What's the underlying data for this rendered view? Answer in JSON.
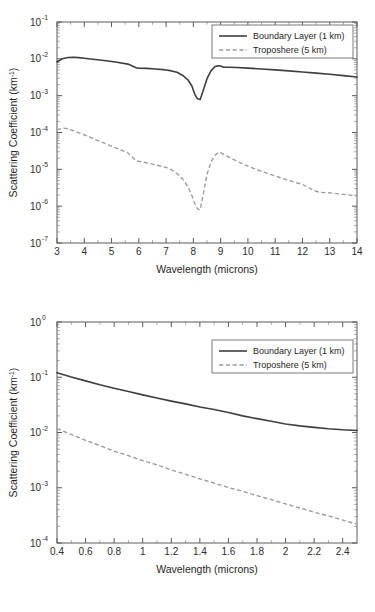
{
  "figure": {
    "panel_count": 2,
    "colors": {
      "boundary_layer": "#3f3f3f",
      "troposphere": "#9a9a9a",
      "axis": "#5a5a5a",
      "background": "#ffffff"
    }
  },
  "chart_data": [
    {
      "id": "infrared-panel",
      "type": "line",
      "title": "",
      "xlabel": "Wavelength (microns)",
      "ylabel": "Scattering Coefficient (km",
      "ylabel_sup": "-1",
      "ylabel_tail": ")",
      "xlim": [
        3,
        14
      ],
      "ylim": [
        1e-07,
        0.1
      ],
      "xscale": "linear",
      "yscale": "log",
      "grid": false,
      "legend_position": "top-right",
      "xticks": [
        "3",
        "4",
        "5",
        "6",
        "7",
        "8",
        "9",
        "10",
        "11",
        "12",
        "13",
        "14"
      ],
      "xtick_values": [
        3,
        4,
        5,
        6,
        7,
        8,
        9,
        10,
        11,
        12,
        13,
        14
      ],
      "yticks": [
        "10-1",
        "10-2",
        "10-3",
        "10-4",
        "10-5",
        "10-6",
        "10-7"
      ],
      "ytick_mantissa": "10",
      "ytick_exponents": [
        "-1",
        "-2",
        "-3",
        "-4",
        "-5",
        "-6",
        "-7"
      ],
      "ytick_values": [
        0.1,
        0.01,
        0.001,
        0.0001,
        1e-05,
        1e-06,
        1e-07
      ],
      "series": [
        {
          "name": "Boundary Layer (1 km)",
          "style": "solid",
          "color": "#3f3f3f",
          "x": [
            3.0,
            3.2,
            3.4,
            3.6,
            3.8,
            4.0,
            4.4,
            4.8,
            5.2,
            5.6,
            5.9,
            6.0,
            6.3,
            6.6,
            6.9,
            7.0,
            7.2,
            7.4,
            7.6,
            7.8,
            7.95,
            8.05,
            8.15,
            8.25,
            8.35,
            8.5,
            8.65,
            8.8,
            8.9,
            9.0,
            9.1,
            9.3,
            9.6,
            10.0,
            10.5,
            11.0,
            11.5,
            12.0,
            12.5,
            13.0,
            13.5,
            14.0
          ],
          "y": [
            0.0082,
            0.0101,
            0.0109,
            0.011,
            0.0108,
            0.0104,
            0.0096,
            0.0089,
            0.0081,
            0.0072,
            0.0057,
            0.0056,
            0.0055,
            0.0053,
            0.0051,
            0.005,
            0.0047,
            0.0043,
            0.0036,
            0.0027,
            0.0018,
            0.0011,
            0.00082,
            0.00079,
            0.0013,
            0.0029,
            0.0048,
            0.0062,
            0.0065,
            0.0064,
            0.0059,
            0.0059,
            0.0058,
            0.0056,
            0.0053,
            0.005,
            0.0047,
            0.0044,
            0.0041,
            0.0038,
            0.0035,
            0.0032
          ]
        },
        {
          "name": "Troposhere (5 km)",
          "style": "dashed",
          "color": "#9a9a9a",
          "x": [
            3.0,
            3.2,
            3.4,
            3.6,
            3.8,
            4.0,
            4.4,
            4.8,
            5.2,
            5.6,
            5.9,
            6.0,
            6.3,
            6.6,
            6.9,
            7.0,
            7.2,
            7.4,
            7.6,
            7.8,
            7.95,
            8.05,
            8.15,
            8.25,
            8.35,
            8.5,
            8.65,
            8.8,
            8.9,
            9.0,
            9.1,
            9.3,
            9.6,
            10.0,
            10.5,
            11.0,
            11.5,
            12.0,
            12.4,
            12.6,
            13.0,
            13.5,
            14.0
          ],
          "y": [
            0.000118,
            0.000132,
            0.000126,
            0.000112,
            9.75e-05,
            8.6e-05,
            6.5e-05,
            4.9e-05,
            3.7e-05,
            2.8e-05,
            1.7e-05,
            1.65e-05,
            1.5e-05,
            1.33e-05,
            1.17e-05,
            1.13e-05,
            9.7e-06,
            7.7e-06,
            5.5e-06,
            3.4e-06,
            1.9e-06,
            1.2e-06,
            8.5e-07,
            8e-07,
            1.9e-06,
            7.3e-06,
            1.6e-05,
            2.45e-05,
            2.8e-05,
            2.85e-05,
            2.55e-05,
            2.15e-05,
            1.65e-05,
            1.22e-05,
            8.8e-06,
            6.6e-06,
            5e-06,
            3.9e-06,
            2.7e-06,
            2.4e-06,
            2.3e-06,
            2.1e-06,
            1.9e-06
          ]
        }
      ]
    },
    {
      "id": "visible-panel",
      "type": "line",
      "title": "",
      "xlabel": "Wavelength (microns)",
      "ylabel": "Scattering Coefficient (km",
      "ylabel_sup": "-1",
      "ylabel_tail": ")",
      "xlim": [
        0.4,
        2.5
      ],
      "ylim": [
        0.0001,
        1
      ],
      "xscale": "linear",
      "yscale": "log",
      "grid": false,
      "legend_position": "top-right",
      "xticks": [
        "0.4",
        "0.6",
        "0.8",
        "1",
        "1.2",
        "1.4",
        "1.6",
        "1.8",
        "2",
        "2.2",
        "2.4"
      ],
      "xtick_values": [
        0.4,
        0.6,
        0.8,
        1.0,
        1.2,
        1.4,
        1.6,
        1.8,
        2.0,
        2.2,
        2.4
      ],
      "yticks": [
        "100",
        "10-1",
        "10-2",
        "10-3",
        "10-4"
      ],
      "ytick_mantissa": "10",
      "ytick_exponents": [
        "0",
        "-1",
        "-2",
        "-3",
        "-4"
      ],
      "ytick_values": [
        1,
        0.1,
        0.01,
        0.001,
        0.0001
      ],
      "series": [
        {
          "name": "Boundary Layer (1 km)",
          "style": "solid",
          "color": "#3f3f3f",
          "x": [
            0.4,
            0.5,
            0.6,
            0.7,
            0.8,
            0.9,
            1.0,
            1.1,
            1.2,
            1.3,
            1.4,
            1.5,
            1.6,
            1.7,
            1.8,
            1.9,
            2.0,
            2.1,
            2.2,
            2.3,
            2.4,
            2.5
          ],
          "y": [
            0.121,
            0.101,
            0.086,
            0.073,
            0.063,
            0.055,
            0.048,
            0.042,
            0.037,
            0.033,
            0.029,
            0.026,
            0.023,
            0.02,
            0.0178,
            0.016,
            0.0143,
            0.0132,
            0.0124,
            0.0117,
            0.0112,
            0.0109
          ]
        },
        {
          "name": "Troposhere (5 km)",
          "style": "dashed",
          "color": "#9a9a9a",
          "x": [
            0.4,
            0.5,
            0.6,
            0.7,
            0.8,
            0.9,
            1.0,
            1.1,
            1.2,
            1.3,
            1.4,
            1.5,
            1.6,
            1.7,
            1.8,
            1.9,
            2.0,
            2.1,
            2.2,
            2.3,
            2.4,
            2.5
          ],
          "y": [
            0.0118,
            0.0092,
            0.0072,
            0.0058,
            0.0046,
            0.0038,
            0.0031,
            0.0026,
            0.0021,
            0.00175,
            0.00145,
            0.00121,
            0.00101,
            0.00086,
            0.00072,
            0.00061,
            0.00051,
            0.00043,
            0.00036,
            0.00031,
            0.00026,
            0.00022
          ]
        }
      ]
    }
  ]
}
